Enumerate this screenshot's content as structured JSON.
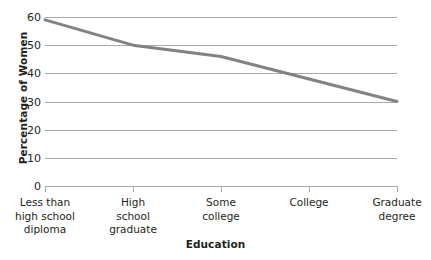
{
  "chart_data": {
    "type": "line",
    "title": "",
    "xlabel": "Education",
    "ylabel": "Percentage of Women",
    "categories": [
      "Less than high school diploma",
      "High school graduate",
      "Some college",
      "College",
      "Graduate degree"
    ],
    "category_lines": [
      [
        "Less than",
        "high school",
        "diploma"
      ],
      [
        "High",
        "school",
        "graduate"
      ],
      [
        "Some",
        "college"
      ],
      [
        "College"
      ],
      [
        "Graduate",
        "degree"
      ]
    ],
    "values": [
      59,
      50,
      46,
      38,
      30
    ],
    "ylim": [
      0,
      60
    ],
    "yticks": [
      60,
      50,
      40,
      30,
      20,
      10,
      0
    ],
    "ytick_labels": [
      "60",
      "50",
      "40",
      "30",
      "20",
      "10",
      "0"
    ],
    "grid": true,
    "legend": false,
    "series_color": "#808285",
    "grid_color": "#a7a9ac",
    "axis_color": "#a7a9ac",
    "text_color": "#231f20",
    "background": "#ffffff",
    "line_width": 3
  }
}
